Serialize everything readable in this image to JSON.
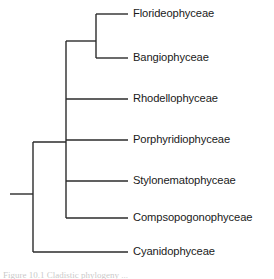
{
  "figure": {
    "type": "phylogenetic-cladogram",
    "background_color": "#ffffff",
    "line_color": "#2b2b2b",
    "text_color": "#1a1a1a",
    "line_width": 1.4
  },
  "tree": {
    "root_stub": {
      "x1": 10,
      "x2": 33,
      "y": 194
    },
    "leaf_tip_x": 128,
    "label_x": 133,
    "leaves": [
      {
        "id": "florideophyceae",
        "label": "Florideophyceae",
        "y": 14,
        "branch_from_x": 96
      },
      {
        "id": "bangiophyceae",
        "label": "Bangiophyceae",
        "y": 58,
        "branch_from_x": 96
      },
      {
        "id": "rhodellophyceae",
        "label": "Rhodellophyceae",
        "y": 99,
        "branch_from_x": 66
      },
      {
        "id": "porphyridiophyceae",
        "label": "Porphyridiophyceae",
        "y": 140,
        "branch_from_x": 66
      },
      {
        "id": "stylonematophyceae",
        "label": "Stylonematophyceae",
        "y": 181,
        "branch_from_x": 66
      },
      {
        "id": "compsopogonophyceae",
        "label": "Compsopogonophyceae",
        "y": 218,
        "branch_from_x": 66
      },
      {
        "id": "cyanidophyceae",
        "label": "Cyanidophyceae",
        "y": 252,
        "branch_from_x": 33
      }
    ],
    "internal_nodes": [
      {
        "id": "node-root",
        "x": 33,
        "y_top": 142,
        "y_bottom": 252
      },
      {
        "id": "node-rhodophyta-core",
        "x": 66,
        "y_top": 41,
        "y_bottom": 218
      },
      {
        "id": "node-bangiophytina",
        "x": 96,
        "y_top": 14,
        "y_bottom": 58
      }
    ],
    "connectors": [
      {
        "id": "connector-root-to-core",
        "x1": 33,
        "x2": 66,
        "y": 142
      },
      {
        "id": "connector-core-to-pair",
        "x1": 66,
        "x2": 96,
        "y": 41
      }
    ]
  },
  "caption": {
    "text": "Figure  10.1  Cladistic phylogeny  ...",
    "visible": false
  }
}
